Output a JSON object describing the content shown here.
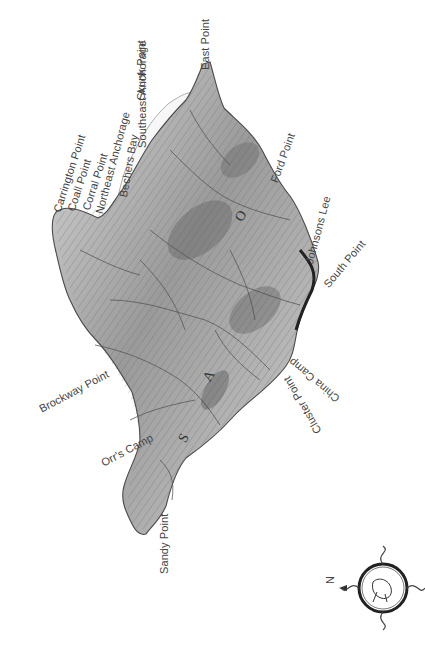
{
  "map": {
    "type": "relief illustration of an island, rotated orientation",
    "island_letters": [
      "S",
      "A",
      "O"
    ],
    "compass": {
      "label": "N",
      "icon": "ornate-compass-rose-icon"
    },
    "places": [
      {
        "id": "east-point",
        "name": "East Point"
      },
      {
        "id": "skunk-point",
        "name": "Skunk Point"
      },
      {
        "id": "southeast-anchorage",
        "name": "Southeast Anchorage"
      },
      {
        "id": "carrington-point",
        "name": "Carrington Point"
      },
      {
        "id": "cooper-point",
        "name": "Coall Point"
      },
      {
        "id": "corral-point",
        "name": "Corral Point"
      },
      {
        "id": "northeast-anchorage",
        "name": "Northeast Anchorage"
      },
      {
        "id": "bechers-bay",
        "name": "Bechers Bay"
      },
      {
        "id": "ford-point",
        "name": "Ford Point"
      },
      {
        "id": "johnsons-lee",
        "name": "Johnsons Lee"
      },
      {
        "id": "south-point",
        "name": "South Point"
      },
      {
        "id": "china-camp",
        "name": "China Camp"
      },
      {
        "id": "cluster-point",
        "name": "Cluster Point"
      },
      {
        "id": "brockway-point",
        "name": "Brockway Point"
      },
      {
        "id": "orrs-camp",
        "name": "Orr's Camp"
      },
      {
        "id": "sandy-point",
        "name": "Sandy Point"
      }
    ]
  }
}
